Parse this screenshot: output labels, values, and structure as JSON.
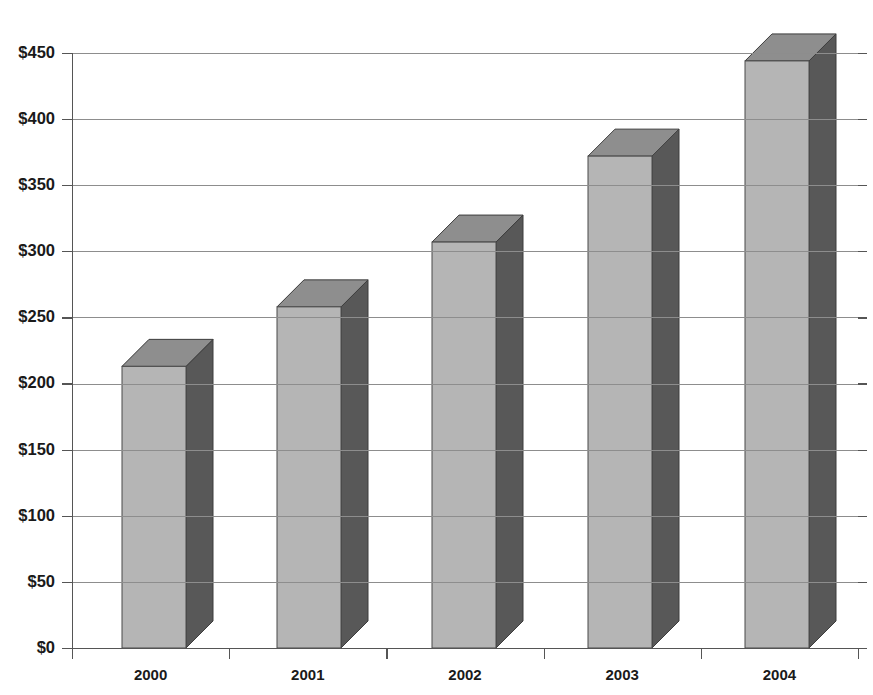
{
  "chart_data": {
    "type": "bar",
    "title": "",
    "subtitle": "",
    "xlabel": "",
    "ylabel": "",
    "categories": [
      "2000",
      "2001",
      "2002",
      "2003",
      "2004"
    ],
    "values": [
      213,
      258,
      307,
      372,
      444
    ],
    "series": [
      {
        "name": "",
        "values": [
          213,
          258,
          307,
          372,
          444
        ]
      }
    ],
    "ylim": [
      0,
      450
    ],
    "ytick_values": [
      0,
      50,
      100,
      150,
      200,
      250,
      300,
      350,
      400,
      450
    ],
    "ytick_labels": [
      "$0",
      "$50",
      "$100",
      "$150",
      "$200",
      "$250",
      "$300",
      "$350",
      "$400",
      "$450"
    ],
    "xtick_labels": [
      "2000",
      "2001",
      "2002",
      "2003",
      "2004"
    ],
    "grid": true,
    "grid_axis": "y",
    "legend": false,
    "legend_position": "none",
    "style_3d": true,
    "annotations": []
  },
  "colors": {
    "bar_front": "#b5b5b5",
    "bar_top": "#8e8e8e",
    "bar_side": "#585858",
    "bar_outline": "#434343",
    "gridline": "#8d8d8d",
    "axis": "#555555",
    "text": "#1a1a1a",
    "background": "#ffffff"
  },
  "geometry": {
    "plot_left": 72,
    "plot_right": 858,
    "plot_top": 53,
    "plot_bottom": 648,
    "pixels_per_unit": 1.3222,
    "bar_front_width": 64,
    "depth_x": 27,
    "depth_y": 27,
    "bar_front_left": [
      122,
      277,
      432,
      588,
      745
    ]
  }
}
